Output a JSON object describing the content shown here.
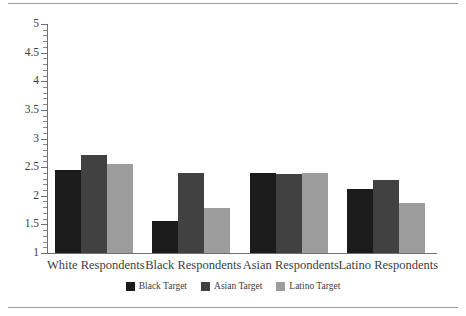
{
  "chart_data": {
    "type": "bar",
    "title": "",
    "xlabel": "",
    "ylabel": "",
    "categories": [
      "White Respondents",
      "Black Respondents",
      "Asian Respondents",
      "Latino Respondents"
    ],
    "series": [
      {
        "name": "Black Target",
        "color": "#1b1b1b",
        "values": [
          2.45,
          1.56,
          2.39,
          2.11
        ]
      },
      {
        "name": "Asian Target",
        "color": "#414141",
        "values": [
          2.71,
          2.39,
          2.38,
          2.28
        ]
      },
      {
        "name": "Latino Target",
        "color": "#9d9d9d",
        "values": [
          2.56,
          1.78,
          2.4,
          1.88
        ]
      }
    ],
    "ylim": [
      1,
      5
    ],
    "ytick_labels": [
      "1",
      "1.5",
      "2",
      "2.5",
      "3",
      "3.5",
      "4",
      "4.5",
      "5"
    ],
    "ytick_values": [
      1,
      1.5,
      2,
      2.5,
      3,
      3.5,
      4,
      4.5,
      5
    ],
    "yminor_step": 0.1,
    "grid": false,
    "legend_position": "bottom",
    "legend": [
      "Black Target",
      "Asian Target",
      "Latino Target"
    ]
  },
  "figure": {
    "top_rule_color": "#9b9b9b",
    "bottom_rule_color": "#9b9b9b",
    "background": "#ffffff",
    "axis_color": "#6f6f6f"
  }
}
